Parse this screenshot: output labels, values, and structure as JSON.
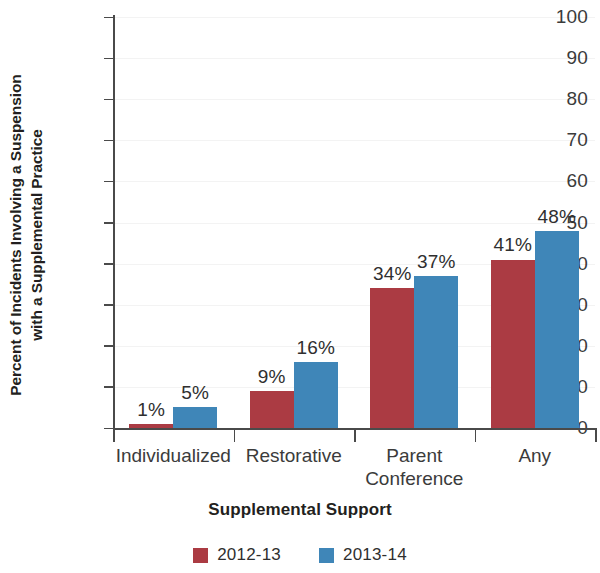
{
  "chart_data": {
    "type": "bar",
    "title": "",
    "xlabel": "Supplemental Support",
    "ylabel": "Percent of Incidents Involving a Suspension with a Supplemental Practice",
    "ylabel_line1": "Percent of Incidents Involving a Suspension",
    "ylabel_line2": "with a Supplemental Practice",
    "categories": [
      "Individualized",
      "Restorative",
      "Parent Conference",
      "Any"
    ],
    "category_lines": [
      [
        "Individualized"
      ],
      [
        "Restorative"
      ],
      [
        "Parent",
        "Conference"
      ],
      [
        "Any"
      ]
    ],
    "series": [
      {
        "name": "2012-13",
        "color": "#ab3b43",
        "values": [
          1,
          9,
          34,
          41
        ],
        "labels": [
          "1%",
          "9%",
          "34%",
          "41%"
        ]
      },
      {
        "name": "2013-14",
        "color": "#3f86b8",
        "values": [
          5,
          16,
          37,
          48
        ],
        "labels": [
          "5%",
          "16%",
          "37%",
          "48%"
        ]
      }
    ],
    "ylim": [
      0,
      100
    ],
    "ytick_values": [
      0,
      10,
      20,
      30,
      40,
      50,
      60,
      70,
      80,
      90,
      100
    ],
    "ytick_labels": [
      "0",
      "10",
      "20",
      "30",
      "40",
      "50",
      "60",
      "70",
      "80",
      "90",
      "100"
    ],
    "grid": "faint-horizontal",
    "legend_position": "bottom-center",
    "value_labels_shown": true
  }
}
